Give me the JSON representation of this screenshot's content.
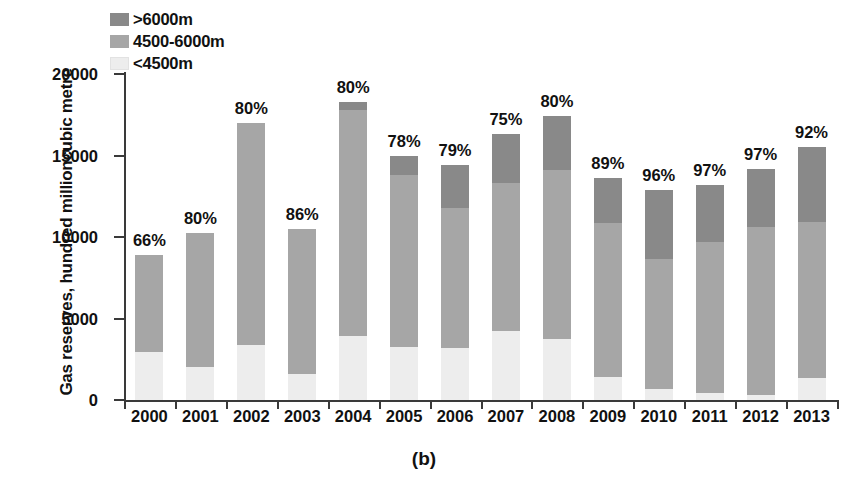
{
  "chart_data": {
    "type": "bar",
    "subtype": "stacked-bar",
    "title": "",
    "caption": "(b)",
    "xlabel": "",
    "ylabel": "Gas reserves, hundred millioncubic metre",
    "categories": [
      "2000",
      "2001",
      "2002",
      "2003",
      "2004",
      "2005",
      "2006",
      "2007",
      "2008",
      "2009",
      "2010",
      "2011",
      "2012",
      "2013"
    ],
    "ylim": [
      0,
      20000
    ],
    "yticks": [
      0,
      5000,
      10000,
      15000,
      20000
    ],
    "ytick_labels": [
      "0",
      "5000",
      "10000",
      "15000",
      "20000"
    ],
    "grid": false,
    "legend_position": "top-left",
    "legend": [
      "&gt;6000m",
      "4500-6000m",
      "&lt;4500m"
    ],
    "series": [
      {
        "name": "<4500m",
        "color": "#ededed",
        "values": [
          2940,
          2030,
          3350,
          1580,
          3950,
          3280,
          3200,
          4220,
          3740,
          1410,
          700,
          420,
          330,
          1350
        ]
      },
      {
        "name": "4500-6000m",
        "color": "#a6a6a6",
        "values": [
          5930,
          8240,
          13650,
          8920,
          13850,
          10550,
          8600,
          9080,
          10360,
          9440,
          7960,
          9260,
          10300,
          9550
        ]
      },
      {
        "name": ">6000m",
        "color": "#898989",
        "values": [
          0,
          0,
          0,
          0,
          500,
          1150,
          2600,
          3000,
          3350,
          2750,
          4240,
          3540,
          3570,
          4600
        ]
      }
    ],
    "totals": [
      8870,
      10270,
      17000,
      10500,
      18300,
      14980,
      14400,
      16300,
      17450,
      13600,
      12900,
      13220,
      14200,
      15500
    ],
    "data_labels": [
      "66%",
      "80%",
      "80%",
      "86%",
      "80%",
      "78%",
      "79%",
      "75%",
      "80%",
      "89%",
      "96%",
      "97%",
      "97%",
      "92%"
    ]
  },
  "legend": {
    "items": [
      {
        "label": ">6000m",
        "swatch": "#898989"
      },
      {
        "label": "4500-6000m",
        "swatch": "#a6a6a6"
      },
      {
        "label": "<4500m",
        "swatch": "#ededed"
      }
    ]
  },
  "axes": {
    "y_title": "Gas reserves, hundred millioncubic metre",
    "y_labels": [
      "20000",
      "15000",
      "10000",
      "5000",
      "0"
    ],
    "x_labels": [
      "2000",
      "2001",
      "2002",
      "2003",
      "2004",
      "2005",
      "2006",
      "2007",
      "2008",
      "2009",
      "2010",
      "2011",
      "2012",
      "2013"
    ]
  },
  "caption": "(b)"
}
